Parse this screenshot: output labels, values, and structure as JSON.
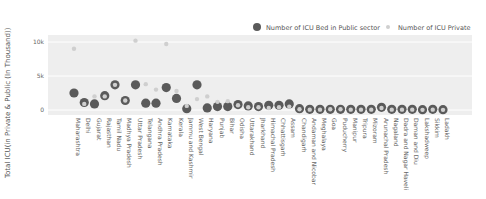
{
  "chart_data": {
    "type": "scatter",
    "title": "",
    "xlabel": "",
    "ylabel": "Total ICU(in Private & Public (In Thousand))",
    "ylim": [
      -1000,
      11000
    ],
    "yticks": [
      0,
      5000,
      10000
    ],
    "ytick_labels": [
      "0",
      "5k",
      "10k"
    ],
    "grid": true,
    "legend_position": "top-right",
    "colors": {
      "public": "#5a5a5a",
      "private": "#cfcfcf",
      "plot_bg": "#eeeeee",
      "grid": "#ffffff"
    },
    "categories": [
      "Maharashtra",
      "Delhi",
      "Gujarat",
      "Rajasthan",
      "Tamil Nadu",
      "Madhya Pradesh",
      "Uttar Pradesh",
      "Telangana",
      "Andhra Pradesh",
      "Karnataka",
      "Kerala",
      "Jammu and Kashmir",
      "West Bengal",
      "Haryana",
      "Punjab",
      "Bihar",
      "Odisha",
      "Uttarakhand",
      "Jharkhand",
      "Himachal Pradesh",
      "Chhattisgarh",
      "Assam",
      "Chandigarh",
      "Andaman and Nicobar",
      "Meghalaya",
      "Goa",
      "Puducherry",
      "Manipur",
      "Tripura",
      "Mizoram",
      "Arunachal Pradesh",
      "Nagaland",
      "Dadra and Nagar Haveli",
      "Daman and Diu",
      "Lakshadweep",
      "Sikkim",
      "Ladakh"
    ],
    "series": [
      {
        "name": "Number of ICU Bed in Public sector",
        "values": [
          2500,
          1100,
          900,
          2100,
          3700,
          1400,
          3700,
          1000,
          1000,
          3300,
          1700,
          200,
          3700,
          300,
          500,
          500,
          800,
          600,
          500,
          700,
          700,
          900,
          200,
          100,
          100,
          100,
          100,
          100,
          100,
          100,
          400,
          100,
          100,
          100,
          50,
          100,
          50
        ]
      },
      {
        "name": "Number of ICU Private",
        "values": [
          9000,
          900,
          2000,
          2000,
          3700,
          1400,
          10200,
          3800,
          3000,
          9700,
          2800,
          600,
          1600,
          2000,
          1200,
          1300,
          700,
          400,
          400,
          300,
          400,
          500,
          100,
          50,
          50,
          100,
          100,
          50,
          50,
          50,
          300,
          50,
          50,
          50,
          20,
          50,
          20
        ]
      }
    ]
  },
  "legend": {
    "public_label": "Number of ICU Bed in Public sector",
    "private_label": "Number of ICU Private"
  }
}
